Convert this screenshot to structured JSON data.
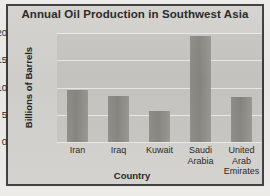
{
  "chart_data": {
    "type": "bar",
    "title": "Annual Oil Production in Southwest Asia",
    "xlabel": "Country",
    "ylabel": "Billions of Barrels",
    "categories": [
      "Iran",
      "Iraq",
      "Kuwait",
      "Saudi Arabia",
      "United Arab Emirates"
    ],
    "values": [
      9.5,
      8.5,
      5.7,
      19.5,
      8.3
    ],
    "ylim": [
      0,
      20
    ],
    "yticks": [
      0,
      5,
      10,
      15,
      20
    ],
    "grid": true,
    "legend": "none",
    "bar_color": "#8c8b86",
    "plot_background": "#c7c6c2",
    "figure_background": "#d2d1cd",
    "text_color": "#22211f"
  },
  "category_lines": [
    [
      "Iran"
    ],
    [
      "Iraq"
    ],
    [
      "Kuwait"
    ],
    [
      "Saudi",
      "Arabia"
    ],
    [
      "United",
      "Arab",
      "Emirates"
    ]
  ]
}
